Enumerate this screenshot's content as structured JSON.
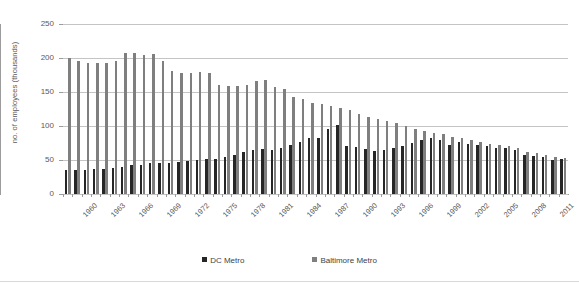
{
  "chart_data": {
    "type": "bar",
    "title": "",
    "subtitle": "",
    "xlabel": "",
    "ylabel": "no. of employees (thousands)",
    "ylim": [
      0,
      250
    ],
    "yticks": [
      0,
      50,
      100,
      150,
      200,
      250
    ],
    "grid": true,
    "legend_position": "bottom",
    "x": [
      1960,
      1961,
      1962,
      1963,
      1964,
      1965,
      1966,
      1967,
      1968,
      1969,
      1970,
      1971,
      1972,
      1973,
      1974,
      1975,
      1976,
      1977,
      1978,
      1979,
      1980,
      1981,
      1982,
      1983,
      1984,
      1985,
      1986,
      1987,
      1988,
      1989,
      1990,
      1991,
      1992,
      1993,
      1994,
      1995,
      1996,
      1997,
      1998,
      1999,
      2000,
      2001,
      2002,
      2003,
      2004,
      2005,
      2006,
      2007,
      2008,
      2009,
      2010,
      2011,
      2012,
      2013
    ],
    "xtick_labels": [
      "1960",
      "1963",
      "1966",
      "1969",
      "1972",
      "1975",
      "1978",
      "1981",
      "1984",
      "1987",
      "1990",
      "1993",
      "1996",
      "1999",
      "2002",
      "2005",
      "2008",
      "2011"
    ],
    "xtick_interval": 3,
    "series": [
      {
        "name": "DC Metro",
        "color": "#262626",
        "values": [
          35,
          35,
          36,
          37,
          37,
          38,
          40,
          42,
          43,
          45,
          46,
          46,
          47,
          48,
          50,
          52,
          52,
          54,
          57,
          62,
          65,
          66,
          64,
          68,
          72,
          76,
          82,
          83,
          96,
          101,
          70,
          69,
          66,
          63,
          65,
          67,
          70,
          75,
          79,
          82,
          80,
          72,
          77,
          73,
          72,
          70,
          68,
          67,
          64,
          58,
          56,
          54,
          50,
          52
        ]
      },
      {
        "name": "Baltimore Metro",
        "color": "#7f7f7f",
        "values": [
          200,
          196,
          193,
          193,
          192,
          196,
          207,
          208,
          205,
          206,
          195,
          181,
          178,
          178,
          180,
          178,
          160,
          159,
          159,
          161,
          166,
          168,
          158,
          155,
          142,
          140,
          134,
          132,
          129,
          127,
          123,
          117,
          113,
          110,
          108,
          105,
          100,
          96,
          93,
          90,
          88,
          84,
          82,
          80,
          77,
          73,
          72,
          70,
          68,
          62,
          60,
          58,
          54,
          53
        ]
      }
    ]
  },
  "legend": {
    "entries": [
      {
        "label": "DC Metro",
        "color": "#262626"
      },
      {
        "label": "Baltimore Metro",
        "color": "#7f7f7f"
      }
    ]
  },
  "axis": {
    "y_title": "no. of employees (thousands)"
  }
}
